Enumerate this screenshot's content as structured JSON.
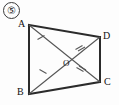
{
  "figure": {
    "item_number": "⑤",
    "item_number_plain": "5",
    "shape_type": "quadrilateral-with-diagonals",
    "stroke_color": "#2b2b2b",
    "diagonal_color": "#555555",
    "tick_color": "#555555",
    "background_color": "#fdfdfd",
    "vertices": [
      {
        "name": "A",
        "label": "A",
        "x": 29,
        "y": 25,
        "label_x": 18,
        "label_y": 19
      },
      {
        "name": "D",
        "label": "D",
        "x": 100,
        "y": 37,
        "label_x": 103,
        "label_y": 31
      },
      {
        "name": "C",
        "label": "C",
        "x": 100,
        "y": 82,
        "label_x": 104,
        "label_y": 78
      },
      {
        "name": "B",
        "label": "B",
        "x": 29,
        "y": 94,
        "label_x": 17,
        "label_y": 88
      }
    ],
    "center": {
      "name": "O",
      "label": "O",
      "x": 64,
      "y": 60,
      "label_x": 64,
      "label_y": 61
    },
    "sides": [
      {
        "name": "AD",
        "from": "A",
        "to": "D"
      },
      {
        "name": "DC",
        "from": "D",
        "to": "C"
      },
      {
        "name": "CB",
        "from": "C",
        "to": "B"
      },
      {
        "name": "BA",
        "from": "B",
        "to": "A"
      }
    ],
    "diagonals": [
      {
        "name": "AC",
        "from": "A",
        "to": "C"
      },
      {
        "name": "BD",
        "from": "B",
        "to": "D"
      }
    ],
    "tick_marks": [
      {
        "segment": "AO",
        "count": 1,
        "x": 41,
        "y": 39
      },
      {
        "segment": "BO",
        "count": 1,
        "x": 43,
        "y": 72
      },
      {
        "segment": "OD",
        "count": 2,
        "x": 80,
        "y": 47
      },
      {
        "segment": "OC",
        "count": 2,
        "x": 81,
        "y": 70
      }
    ]
  }
}
